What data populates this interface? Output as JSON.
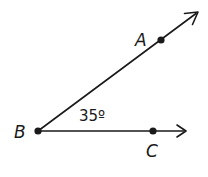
{
  "diagram": {
    "type": "geometry-angle",
    "vertex": {
      "label": "B",
      "x": 38,
      "y": 131
    },
    "rays": [
      {
        "name": "ray-BA",
        "through_point": {
          "label": "A",
          "x": 161,
          "y": 40
        },
        "arrow_tip": {
          "x": 198,
          "y": 12
        }
      },
      {
        "name": "ray-BC",
        "through_point": {
          "label": "C",
          "x": 153,
          "y": 131
        },
        "arrow_tip": {
          "x": 186,
          "y": 131
        }
      }
    ],
    "angle_label": "35º",
    "angle_value_degrees": 35,
    "labels": {
      "A": "A",
      "B": "B",
      "C": "C"
    },
    "colors": {
      "stroke": "#1a1a1a",
      "background": "#ffffff"
    }
  }
}
